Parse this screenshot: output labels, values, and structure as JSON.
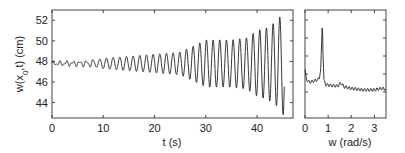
{
  "chart_data": [
    {
      "type": "line",
      "title": "",
      "xlabel": "t (s)",
      "ylabel": "w(x_0,t) (cm)",
      "xlim": [
        0,
        47
      ],
      "ylim": [
        42.5,
        53
      ],
      "xticks": [
        0,
        10,
        20,
        30,
        40
      ],
      "yticks": [
        44,
        46,
        48,
        50,
        52
      ],
      "grid": false,
      "series": [
        {
          "name": "w(x0,t)",
          "description": "Oscillation around ~47.8 cm with period ~1.3 s and growing amplitude",
          "envelope": {
            "t": [
              0,
              5,
              8,
              10,
              15,
              20,
              25,
              28,
              30,
              35,
              38,
              40,
              42,
              44,
              45
            ],
            "amplitude": [
              0.15,
              0.2,
              0.3,
              0.5,
              0.7,
              0.9,
              1.1,
              1.8,
              2.3,
              2.3,
              2.5,
              3.2,
              3.5,
              4.2,
              5.0
            ]
          },
          "mean": 47.8,
          "period_s": 1.3
        }
      ]
    },
    {
      "type": "line",
      "title": "",
      "xlabel": "w (rad/s)",
      "ylabel": "",
      "xlim": [
        0,
        3.5
      ],
      "xticks": [
        0,
        1,
        2,
        3
      ],
      "grid": false,
      "series": [
        {
          "name": "spectrum",
          "x": [
            0.0,
            0.05,
            0.2,
            0.4,
            0.6,
            0.68,
            0.72,
            0.75,
            0.78,
            0.82,
            0.9,
            1.1,
            1.4,
            1.55,
            1.7,
            2.0,
            2.5,
            3.0,
            3.3,
            3.5
          ],
          "values": [
            0.35,
            0.22,
            0.18,
            0.2,
            0.22,
            0.35,
            0.7,
            1.0,
            0.55,
            0.2,
            0.15,
            0.14,
            0.13,
            0.17,
            0.12,
            0.1,
            0.08,
            0.08,
            0.1,
            0.09
          ]
        }
      ]
    }
  ]
}
